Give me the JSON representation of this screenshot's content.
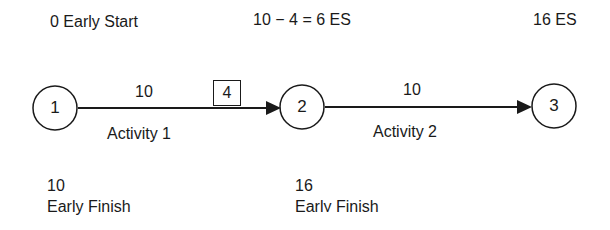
{
  "annotations": {
    "node1_es": "0 Early Start",
    "node2_es": "10 − 4 = 6 ES",
    "node3_es": "16 ES",
    "node2_ef_value": "10",
    "node2_ef_label": "Early Finish",
    "node3_ef_value": "16",
    "node3_ef_label": "Early Finish"
  },
  "nodes": [
    {
      "id": "1",
      "label": "1"
    },
    {
      "id": "2",
      "label": "2"
    },
    {
      "id": "3",
      "label": "3"
    }
  ],
  "activities": [
    {
      "name": "Activity 1",
      "duration": "10",
      "lag_box": "4",
      "from": "1",
      "to": "2"
    },
    {
      "name": "Activity 2",
      "duration": "10",
      "from": "2",
      "to": "3"
    }
  ]
}
